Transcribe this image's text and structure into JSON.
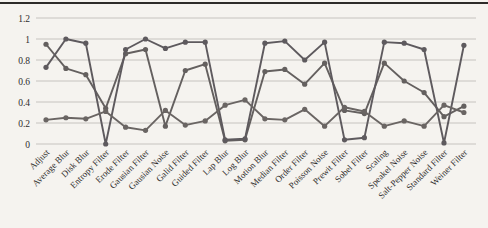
{
  "figure": {
    "kind": "scanned line chart",
    "background_color": "#f5f3ef",
    "top_rule_color": "#2d2b29"
  },
  "chart_data": {
    "type": "line",
    "title": "",
    "xlabel": "",
    "ylabel": "",
    "legend": "none",
    "grid": "horizontal",
    "marker": "circle",
    "ylim": [
      0,
      1.2
    ],
    "yticks": [
      0,
      0.2,
      0.4,
      0.6,
      0.8,
      1,
      1.2
    ],
    "ytick_labels": [
      "0",
      "0.2",
      "0.4",
      "0.6",
      "0.8",
      "1",
      "1.2"
    ],
    "grid_color": "#c6c3bf",
    "tick_text_color": "#2f2d2c",
    "categories": [
      "Adjust",
      "Average Blur",
      "Disk Blur",
      "Entropy Filter",
      "Erode Filter",
      "Gausian Filter",
      "Gausian Noise",
      "Galid Filter",
      "Guided Filter",
      "Lap Blur",
      "Log Blur",
      "Motion Blur",
      "Median Filter",
      "Order Filter",
      "Poisson Noise",
      "Prewit Filter",
      "Sobel Filter",
      "Scaling",
      "Speakel Noise",
      "Salt-Pepper Noise",
      "Standard Filter",
      "Weiner Filter"
    ],
    "series": [
      {
        "name": "series-1",
        "color": "#64605f",
        "values": [
          0.95,
          0.72,
          0.66,
          0.34,
          0.86,
          0.9,
          0.17,
          0.7,
          0.76,
          0.03,
          0.04,
          0.69,
          0.71,
          0.57,
          0.77,
          0.32,
          0.29,
          0.77,
          0.6,
          0.49,
          0.26,
          0.36
        ]
      },
      {
        "name": "series-2",
        "color": "#5e5a5e",
        "values": [
          0.73,
          1.0,
          0.96,
          0.0,
          0.9,
          1.0,
          0.91,
          0.97,
          0.97,
          0.04,
          0.05,
          0.96,
          0.98,
          0.8,
          0.97,
          0.04,
          0.06,
          0.97,
          0.96,
          0.9,
          0.01,
          0.94
        ]
      },
      {
        "name": "series-3",
        "color": "#6a6563",
        "values": [
          0.23,
          0.25,
          0.24,
          0.31,
          0.16,
          0.13,
          0.32,
          0.18,
          0.22,
          0.37,
          0.42,
          0.24,
          0.23,
          0.33,
          0.17,
          0.35,
          0.31,
          0.17,
          0.22,
          0.17,
          0.37,
          0.3
        ]
      }
    ]
  }
}
